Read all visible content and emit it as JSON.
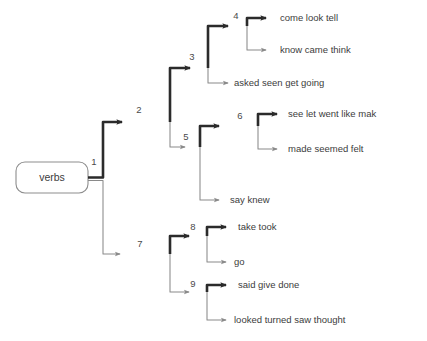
{
  "diagram": {
    "type": "binary-decision-tree",
    "title": "verbs",
    "root": {
      "label": "verbs",
      "shape": "rounded-rectangle"
    },
    "colors": {
      "thick_edge": "#2b2b2b",
      "thin_edge": "#8a8a8a",
      "box_stroke": "#8d8d8d",
      "text": "#3c3c3c",
      "background": "#ffffff"
    },
    "split_labels": [
      "1",
      "2",
      "3",
      "4",
      "5",
      "6",
      "7",
      "8",
      "9"
    ],
    "nodes": {
      "n1": {
        "label": "1"
      },
      "n2": {
        "label": "2"
      },
      "n3": {
        "label": "3"
      },
      "n4": {
        "label": "4"
      },
      "n5": {
        "label": "5"
      },
      "n6": {
        "label": "6"
      },
      "n7": {
        "label": "7"
      },
      "n8": {
        "label": "8"
      },
      "n9": {
        "label": "9"
      }
    },
    "leaves": {
      "l1": {
        "text": "come   look   tell",
        "branch": "thick"
      },
      "l2": {
        "text": "know   came   think",
        "branch": "thin"
      },
      "l3": {
        "text": "asked   seen   get   going",
        "branch": "thin"
      },
      "l4": {
        "text": "see   let   went   like   mak",
        "branch": "thick"
      },
      "l5": {
        "text": "made   seemed   felt",
        "branch": "thin"
      },
      "l6": {
        "text": "say   knew",
        "branch": "thin"
      },
      "l7": {
        "text": "take   took",
        "branch": "thick"
      },
      "l8": {
        "text": "go",
        "branch": "thin"
      },
      "l9": {
        "text": "said   give   done",
        "branch": "thick"
      },
      "l10": {
        "text": "looked   turned   saw   thought",
        "branch": "thin"
      }
    }
  }
}
